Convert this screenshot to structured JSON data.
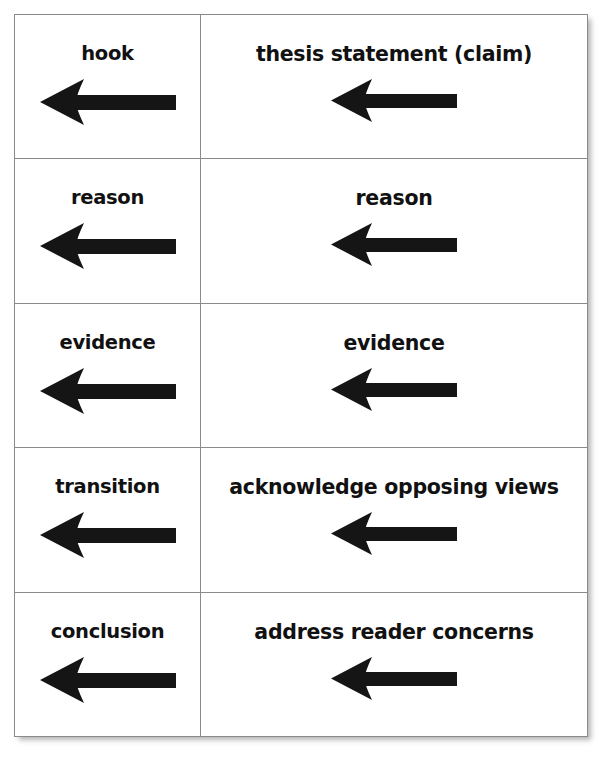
{
  "document": {
    "background_color": "#ffffff",
    "border_color": "#8a8a8a",
    "text_color": "#111111",
    "arrow_color": "#151515"
  },
  "table": {
    "columns": 2,
    "rows": 5,
    "arrow_icon_name": "left-arrow-icon",
    "arrow_direction": "left",
    "cells": [
      {
        "left": "hook",
        "right": "thesis statement (claim)"
      },
      {
        "left": "reason",
        "right": "reason"
      },
      {
        "left": "evidence",
        "right": "evidence"
      },
      {
        "left": "transition",
        "right": "acknowledge opposing views"
      },
      {
        "left": "conclusion",
        "right": "address reader concerns"
      }
    ]
  }
}
